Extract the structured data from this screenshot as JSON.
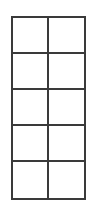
{
  "diagram": {
    "type": "empty-grid",
    "rows": 5,
    "columns": 2,
    "line_color": "#3a3a3a",
    "background": "#ffffff",
    "cells": [
      [
        "",
        ""
      ],
      [
        "",
        ""
      ],
      [
        "",
        ""
      ],
      [
        "",
        ""
      ],
      [
        "",
        ""
      ]
    ]
  }
}
